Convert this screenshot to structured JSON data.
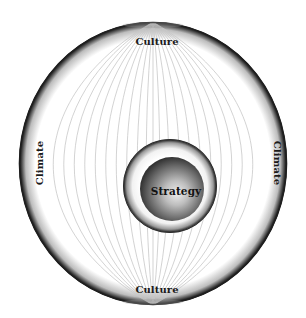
{
  "diagram": {
    "type": "nested-circles",
    "outer_circle": {
      "label_top": "Culture",
      "label_bottom": "Culture",
      "label_left": "Climate",
      "label_right": "Climate",
      "meridian_line_color": "#c8c8c8",
      "rim_color": "#1e1e1e"
    },
    "middle_ring": {
      "rim_color": "#2a2a2a"
    },
    "inner_sphere": {
      "label": "Strategy",
      "highlight_color": "#e4e4e4",
      "edge_color": "#3a3a3a"
    }
  }
}
